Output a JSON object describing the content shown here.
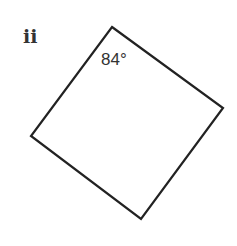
{
  "figure": {
    "label": "ii",
    "shape": "quadrilateral",
    "vertices": [
      {
        "name": "top",
        "x": 112,
        "y": 27
      },
      {
        "name": "right",
        "x": 223,
        "y": 108
      },
      {
        "name": "bottom",
        "x": 141,
        "y": 219
      },
      {
        "name": "left",
        "x": 31,
        "y": 136
      }
    ],
    "angles": [
      {
        "vertex": "top",
        "text": "84°"
      }
    ],
    "stroke_color": "#222222",
    "text_color": "#333333"
  }
}
